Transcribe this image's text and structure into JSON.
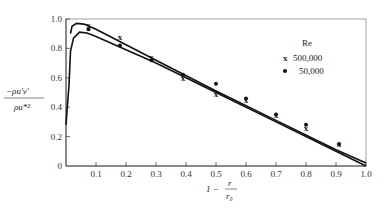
{
  "chart_data": {
    "type": "scatter",
    "title": "",
    "xlabel": "1 - r/r0",
    "ylabel": "-ρ u'v' / ρ u*²",
    "xlim": [
      0,
      1.0
    ],
    "ylim": [
      0,
      1.0
    ],
    "grid": false,
    "legend_position": "upper right (inside)",
    "legend_title": "Re",
    "x_ticks": [
      "0.1",
      "0.2",
      "0.3",
      "0.4",
      "0.5",
      "0.6",
      "0.7",
      "0.8",
      "0.9",
      "1.0"
    ],
    "y_ticks": [
      "0",
      "0.2",
      "0.4",
      "0.6",
      "0.8",
      "1.0"
    ],
    "series": [
      {
        "name": "500,000",
        "marker": "x",
        "points": [
          {
            "x": 0.075,
            "y": 0.96
          },
          {
            "x": 0.18,
            "y": 0.88
          },
          {
            "x": 0.285,
            "y": 0.74
          },
          {
            "x": 0.39,
            "y": 0.6
          },
          {
            "x": 0.5,
            "y": 0.49
          },
          {
            "x": 0.6,
            "y": 0.45
          },
          {
            "x": 0.7,
            "y": 0.35
          },
          {
            "x": 0.8,
            "y": 0.26
          },
          {
            "x": 0.91,
            "y": 0.15
          }
        ]
      },
      {
        "name": "50,000",
        "marker": "dot",
        "points": [
          {
            "x": 0.075,
            "y": 0.93
          },
          {
            "x": 0.18,
            "y": 0.82
          },
          {
            "x": 0.285,
            "y": 0.72
          },
          {
            "x": 0.39,
            "y": 0.62
          },
          {
            "x": 0.5,
            "y": 0.56
          },
          {
            "x": 0.6,
            "y": 0.46
          },
          {
            "x": 0.7,
            "y": 0.35
          },
          {
            "x": 0.8,
            "y": 0.28
          },
          {
            "x": 0.91,
            "y": 0.15
          }
        ]
      }
    ],
    "curves": [
      {
        "name": "theory-upper (Re 500,000)",
        "points": [
          [
            0.015,
            0.9
          ],
          [
            0.02,
            0.95
          ],
          [
            0.035,
            0.97
          ],
          [
            0.06,
            0.965
          ],
          [
            0.1,
            0.93
          ],
          [
            0.3,
            0.72
          ],
          [
            0.5,
            0.51
          ],
          [
            0.7,
            0.31
          ],
          [
            0.9,
            0.11
          ],
          [
            1.0,
            0.02
          ]
        ]
      },
      {
        "name": "theory-lower (Re 50,000)",
        "points": [
          [
            0.0,
            0.28
          ],
          [
            0.01,
            0.55
          ],
          [
            0.015,
            0.78
          ],
          [
            0.025,
            0.87
          ],
          [
            0.045,
            0.91
          ],
          [
            0.07,
            0.905
          ],
          [
            0.1,
            0.88
          ],
          [
            0.3,
            0.7
          ],
          [
            0.5,
            0.5
          ],
          [
            0.7,
            0.3
          ],
          [
            0.9,
            0.1
          ],
          [
            1.0,
            0.0
          ]
        ]
      }
    ]
  },
  "labels": {
    "ylabel_num": "−ρu′v′",
    "ylabel_den": "ρu*²",
    "xlabel_prefix": "1 −",
    "xlabel_num": "r",
    "xlabel_den": "r₀",
    "legend_title": "Re",
    "legend_x": "500,000",
    "legend_dot": "50,000"
  }
}
